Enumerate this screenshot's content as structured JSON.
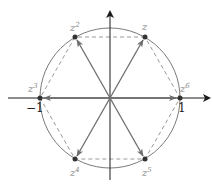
{
  "diagram": {
    "center": [
      110,
      98
    ],
    "radius": 70,
    "colors": {
      "axis": "#1a1a1a",
      "circle": "#7a7a7a",
      "arrow": "#6e6e6e",
      "dashed": "#9a9a9a",
      "point": "#333333",
      "label": "#8a8a8a"
    },
    "axis_labels": {
      "neg_one": "−1",
      "one": "1"
    },
    "points": [
      {
        "name": "z",
        "base": "z",
        "exp": "",
        "x": 145,
        "y": 37,
        "lx": 142,
        "ly": 30
      },
      {
        "name": "z2",
        "base": "z",
        "exp": "2",
        "x": 75,
        "y": 37,
        "lx": 70,
        "ly": 30
      },
      {
        "name": "z3",
        "base": "z",
        "exp": "3",
        "x": 40,
        "y": 98,
        "lx": 28,
        "ly": 92
      },
      {
        "name": "z4",
        "base": "z",
        "exp": "4",
        "x": 75,
        "y": 159,
        "lx": 70,
        "ly": 174
      },
      {
        "name": "z5",
        "base": "z",
        "exp": "5",
        "x": 145,
        "y": 159,
        "lx": 143,
        "ly": 174
      },
      {
        "name": "z6",
        "base": "z",
        "exp": "6",
        "x": 180,
        "y": 98,
        "lx": 180,
        "ly": 92
      }
    ]
  }
}
